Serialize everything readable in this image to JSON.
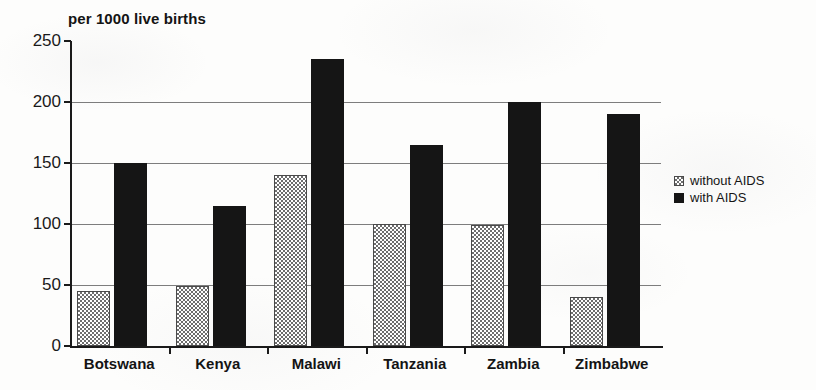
{
  "chart_data": {
    "type": "bar",
    "title": "per 1000 live births",
    "xlabel": "",
    "ylabel": "",
    "ylim": [
      0,
      250
    ],
    "yticks": [
      0,
      50,
      100,
      150,
      200,
      250
    ],
    "ytick_labels": [
      "0",
      "50",
      "100",
      "150",
      "200",
      "250"
    ],
    "gridlines": [
      50,
      100,
      150,
      200
    ],
    "grid": true,
    "legend_position": "right",
    "categories": [
      "Botswana",
      "Kenya",
      "Malawi",
      "Tanzania",
      "Zambia",
      "Zimbabwe"
    ],
    "series": [
      {
        "name": "without AIDS",
        "values": [
          45,
          49,
          140,
          100,
          99,
          40
        ],
        "style": "stipple"
      },
      {
        "name": "with AIDS",
        "values": [
          150,
          115,
          235,
          165,
          200,
          190
        ],
        "style": "solid-black"
      }
    ]
  },
  "legend": {
    "items": [
      {
        "label": "without AIDS",
        "swatch": "stipple-swatch-icon"
      },
      {
        "label": "with AIDS",
        "swatch": "solid-swatch-icon"
      }
    ]
  },
  "colors": {
    "series_with_aids": "#151515",
    "series_without_aids_outline": "#4a4a4a",
    "axis": "#1a1a1a",
    "gridline": "#7d7d7d",
    "background": "#fdfdfc"
  }
}
